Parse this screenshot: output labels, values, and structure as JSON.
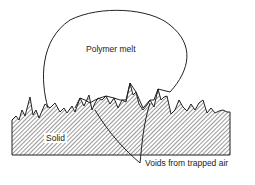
{
  "diagram": {
    "labels": {
      "melt": "Polymer melt",
      "solid": "Solid",
      "voids": "Voids from trapped air"
    },
    "colors": {
      "line": "#222222",
      "hatch": "#333333",
      "background": "#ffffff"
    }
  }
}
